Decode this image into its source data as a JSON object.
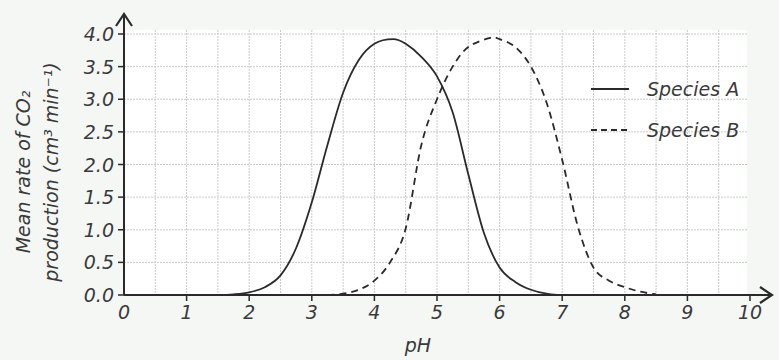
{
  "chart_data": {
    "type": "line",
    "title": "",
    "xlabel": "pH",
    "ylabel_line1": "Mean rate of CO₂",
    "ylabel_line2": "production (cm³ min⁻¹)",
    "ylabel": "Mean rate of CO2 production (cm3 min-1)",
    "xlim": [
      0,
      10
    ],
    "ylim": [
      0,
      4.0
    ],
    "x_ticks": [
      "0",
      "1",
      "2",
      "3",
      "4",
      "5",
      "6",
      "7",
      "8",
      "9",
      "10"
    ],
    "y_ticks": [
      "0.0",
      "0.5",
      "1.0",
      "1.5",
      "2.0",
      "2.5",
      "3.0",
      "3.5",
      "4.0"
    ],
    "grid": true,
    "legend_position": "upper right",
    "series": [
      {
        "name": "Species A",
        "style": "solid",
        "x": [
          0,
          1,
          1.5,
          1.75,
          2.0,
          2.25,
          2.5,
          2.75,
          3.0,
          3.25,
          3.5,
          3.75,
          4.0,
          4.3,
          4.5,
          4.75,
          5.0,
          5.25,
          5.5,
          5.75,
          6.0,
          6.25,
          6.5,
          6.75,
          7.0,
          8.0,
          10.0
        ],
        "values": [
          0,
          0,
          0,
          0.01,
          0.04,
          0.12,
          0.3,
          0.72,
          1.42,
          2.3,
          3.1,
          3.6,
          3.85,
          3.92,
          3.85,
          3.65,
          3.35,
          2.8,
          1.85,
          0.95,
          0.42,
          0.2,
          0.08,
          0.02,
          0,
          0,
          0
        ]
      },
      {
        "name": "Species B",
        "style": "dashed",
        "x": [
          3.25,
          3.5,
          3.75,
          4.0,
          4.25,
          4.5,
          4.75,
          5.0,
          5.25,
          5.5,
          5.85,
          6.0,
          6.25,
          6.5,
          6.75,
          7.0,
          7.25,
          7.5,
          7.75,
          8.0,
          8.25,
          8.5
        ],
        "values": [
          0,
          0.02,
          0.08,
          0.22,
          0.5,
          1.02,
          2.3,
          3.0,
          3.5,
          3.8,
          3.94,
          3.92,
          3.8,
          3.5,
          2.95,
          2.07,
          1.05,
          0.42,
          0.22,
          0.12,
          0.05,
          0.01
        ]
      }
    ]
  },
  "legend": {
    "items": [
      {
        "label": "Species A",
        "style": "solid"
      },
      {
        "label": "Species B",
        "style": "dashed"
      }
    ]
  },
  "colors": {
    "background": "#f4f7f4",
    "plot_background": "#ffffff",
    "grid": "#c9ccc9",
    "axis": "#2a2a2a",
    "line": "#2a2a2a"
  }
}
